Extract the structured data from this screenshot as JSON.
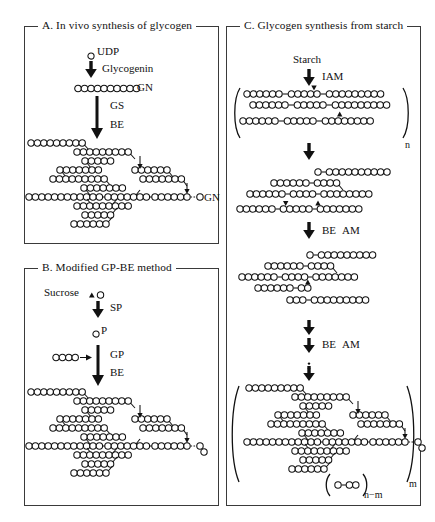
{
  "figure": {
    "type": "scientific-schematic"
  },
  "panels": [
    {
      "id": "A",
      "title": "A. In vivo synthesis of glycogen",
      "labels": {
        "substrate": "UDP",
        "enzyme1": "Glycogenin",
        "primer_tag": "GN",
        "enzyme2": "GS",
        "enzyme3": "BE",
        "product_tag": "GN"
      },
      "primer_units": 10
    },
    {
      "id": "B",
      "title": "B. Modified GP-BE method",
      "labels": {
        "substrate": "Sucrose",
        "enzyme1": "SP",
        "intermediate": "P",
        "enzyme2": "GP",
        "enzyme3": "BE"
      },
      "primer_units": 4
    },
    {
      "id": "C",
      "title": "C. Glycogen synthesis from starch",
      "labels": {
        "substrate": "Starch",
        "enzyme1": "IAM",
        "enzyme2": "BE",
        "enzyme3": "AM",
        "enzyme4": "BE",
        "enzyme5": "AM",
        "bracket_n": "n",
        "bracket_m": "m",
        "residual_formula_sub": "n−m"
      }
    }
  ],
  "legend_symbols": {
    "open_circle": "glucose residue",
    "filled_triangle": "fructose residue",
    "chain_line": "alpha-1,4 linkage",
    "branch_line": "alpha-1,6 branch point"
  },
  "colors": {
    "ink": "#111111",
    "border": "#3a3a3a",
    "background": "#ffffff"
  }
}
